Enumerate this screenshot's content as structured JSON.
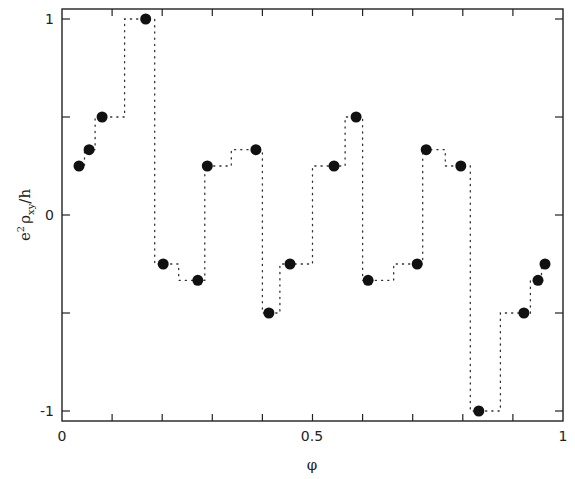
{
  "chart_data": {
    "type": "scatter",
    "title": "",
    "xlabel": "φ",
    "ylabel": "e²ρxy/h",
    "xlim": [
      0,
      1
    ],
    "ylim": [
      -1.05,
      1.05
    ],
    "grid": false,
    "legend": null,
    "x_ticks": [
      0,
      0.1,
      0.2,
      0.3,
      0.4,
      0.5,
      0.6,
      0.7,
      0.8,
      0.9,
      1
    ],
    "x_tick_labels": [
      {
        "value": 0,
        "label": "0"
      },
      {
        "value": 0.5,
        "label": "0.5"
      },
      {
        "value": 1,
        "label": "1"
      }
    ],
    "y_ticks": [
      -1,
      -0.5,
      0,
      0.5,
      1
    ],
    "y_tick_labels": [
      {
        "value": 1,
        "label": "1"
      },
      {
        "value": 0,
        "label": "0"
      },
      {
        "value": -1,
        "label": "-1"
      }
    ],
    "series": [
      {
        "name": "Hall resistivity points",
        "marker": "filled-circle",
        "color": "#111111",
        "x": [
          0.034,
          0.054,
          0.08,
          0.167,
          0.202,
          0.271,
          0.29,
          0.387,
          0.413,
          0.455,
          0.543,
          0.587,
          0.611,
          0.709,
          0.727,
          0.796,
          0.832,
          0.922,
          0.95,
          0.964
        ],
        "y": [
          0.25,
          0.333,
          0.5,
          1.0,
          -0.25,
          -0.333,
          0.25,
          0.333,
          -0.5,
          -0.25,
          0.25,
          0.5,
          -0.333,
          -0.25,
          0.333,
          0.25,
          -1.0,
          -0.5,
          -0.333,
          -0.25
        ]
      }
    ],
    "step_line": {
      "style": "dotted",
      "color": "#333333",
      "points": [
        [
          0.034,
          0.25
        ],
        [
          0.045,
          0.25
        ],
        [
          0.045,
          0.333
        ],
        [
          0.054,
          0.333
        ],
        [
          0.066,
          0.333
        ],
        [
          0.066,
          0.5
        ],
        [
          0.08,
          0.5
        ],
        [
          0.125,
          0.5
        ],
        [
          0.125,
          1.0
        ],
        [
          0.167,
          1.0
        ],
        [
          0.185,
          1.0
        ],
        [
          0.185,
          -0.25
        ],
        [
          0.202,
          -0.25
        ],
        [
          0.233,
          -0.25
        ],
        [
          0.233,
          -0.333
        ],
        [
          0.271,
          -0.333
        ],
        [
          0.285,
          -0.333
        ],
        [
          0.285,
          0.25
        ],
        [
          0.29,
          0.25
        ],
        [
          0.338,
          0.25
        ],
        [
          0.338,
          0.333
        ],
        [
          0.387,
          0.333
        ],
        [
          0.4,
          0.333
        ],
        [
          0.4,
          -0.5
        ],
        [
          0.413,
          -0.5
        ],
        [
          0.435,
          -0.5
        ],
        [
          0.435,
          -0.25
        ],
        [
          0.455,
          -0.25
        ],
        [
          0.5,
          -0.25
        ],
        [
          0.5,
          0.25
        ],
        [
          0.543,
          0.25
        ],
        [
          0.565,
          0.25
        ],
        [
          0.565,
          0.5
        ],
        [
          0.587,
          0.5
        ],
        [
          0.6,
          0.5
        ],
        [
          0.6,
          -0.333
        ],
        [
          0.611,
          -0.333
        ],
        [
          0.662,
          -0.333
        ],
        [
          0.662,
          -0.25
        ],
        [
          0.709,
          -0.25
        ],
        [
          0.72,
          -0.25
        ],
        [
          0.72,
          0.333
        ],
        [
          0.727,
          0.333
        ],
        [
          0.765,
          0.333
        ],
        [
          0.765,
          0.25
        ],
        [
          0.796,
          0.25
        ],
        [
          0.815,
          0.25
        ],
        [
          0.815,
          -1.0
        ],
        [
          0.832,
          -1.0
        ],
        [
          0.875,
          -1.0
        ],
        [
          0.875,
          -0.5
        ],
        [
          0.922,
          -0.5
        ],
        [
          0.935,
          -0.5
        ],
        [
          0.935,
          -0.333
        ],
        [
          0.95,
          -0.333
        ],
        [
          0.957,
          -0.333
        ],
        [
          0.957,
          -0.25
        ],
        [
          0.964,
          -0.25
        ]
      ]
    }
  },
  "labels": {
    "x_axis": "φ",
    "y_axis_main": "e",
    "y_axis_sup": "2",
    "y_axis_rho": "ρ",
    "y_axis_sub": "xy",
    "y_axis_tail": "/h",
    "x_tick_0": "0",
    "x_tick_05": "0.5",
    "x_tick_1": "1",
    "y_tick_1": "1",
    "y_tick_0": "0",
    "y_tick_m1": "-1"
  }
}
